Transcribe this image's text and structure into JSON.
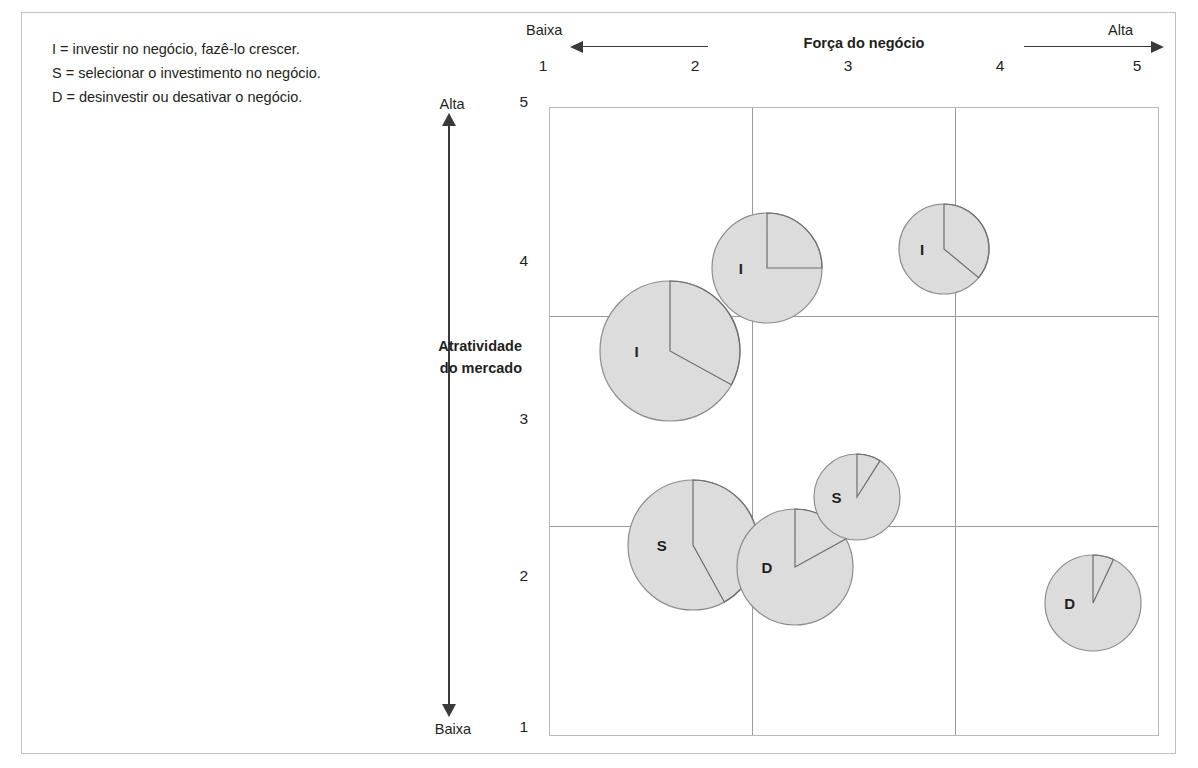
{
  "legend": {
    "lines": [
      "I = investir no negócio, fazê-lo crescer.",
      "S = selecionar o investimento no negócio.",
      "D = desinvestir ou desativar o negócio."
    ]
  },
  "x_axis": {
    "title": "Força do negócio",
    "low_label": "Baixa",
    "high_label": "Alta",
    "ticks": [
      "1",
      "2",
      "3",
      "4",
      "5"
    ]
  },
  "y_axis": {
    "title_line1": "Atratividade",
    "title_line2": "do mercado",
    "high_label": "Alta",
    "low_label": "Baixa",
    "ticks": [
      "5",
      "4",
      "3",
      "2",
      "1"
    ]
  },
  "colors": {
    "bubble_fill": "#dcdcdc",
    "bubble_stroke": "#8c8c8c",
    "wedge_stroke": "#6e6e6e",
    "gridline": "#9a9a9a",
    "plot_border": "#b9b9b9",
    "frame_border": "#bfbfbf",
    "text": "#231f20",
    "arrow": "#3a3a3a"
  },
  "chart_data": {
    "type": "scatter",
    "xlabel": "Força do negócio",
    "ylabel": "Atratividade do mercado",
    "xlim": [
      1,
      5
    ],
    "ylim": [
      1,
      5
    ],
    "xticks": [
      1,
      2,
      3,
      4,
      5
    ],
    "yticks": [
      1,
      2,
      3,
      4,
      5
    ],
    "grid": true,
    "gridlines_x": [
      2.33,
      3.67
    ],
    "gridlines_y": [
      2.33,
      3.67
    ],
    "legend_position": "top-left",
    "bubbles": [
      {
        "label": "I",
        "x": 1.79,
        "y": 3.45,
        "size_r": 70,
        "share_pct": 33
      },
      {
        "label": "I",
        "x": 2.43,
        "y": 3.98,
        "size_r": 55,
        "share_pct": 25
      },
      {
        "label": "I",
        "x": 3.59,
        "y": 4.1,
        "size_r": 45,
        "share_pct": 36
      },
      {
        "label": "S",
        "x": 1.94,
        "y": 2.21,
        "size_r": 65,
        "share_pct": 42
      },
      {
        "label": "D",
        "x": 2.61,
        "y": 2.07,
        "size_r": 58,
        "share_pct": 17
      },
      {
        "label": "S",
        "x": 3.02,
        "y": 2.52,
        "size_r": 43,
        "share_pct": 9
      },
      {
        "label": "D",
        "x": 4.57,
        "y": 1.84,
        "size_r": 48,
        "share_pct": 7
      }
    ]
  }
}
